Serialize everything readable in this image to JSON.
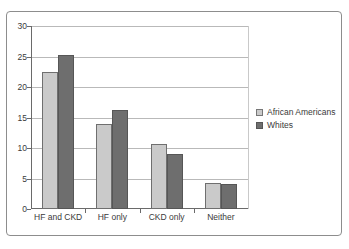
{
  "chart_data": {
    "type": "bar",
    "title": "",
    "subtitle": "",
    "xlabel": "",
    "ylabel": "",
    "categories": [
      "HF and CKD",
      "HF only",
      "CKD only",
      "Neither"
    ],
    "series": [
      {
        "name": "African Americans",
        "color": "#cacaca",
        "values": [
          22.5,
          13.9,
          10.6,
          4.3
        ]
      },
      {
        "name": "Whites",
        "color": "#6e6e6e",
        "values": [
          25.2,
          16.2,
          9.0,
          4.1
        ]
      }
    ],
    "ylim": [
      0,
      30
    ],
    "yticks": [
      "0",
      "5",
      "10",
      "15",
      "20",
      "25",
      "30"
    ],
    "ytick_values": [
      0,
      5,
      10,
      15,
      20,
      25,
      30
    ],
    "grid": "horizontal",
    "legend_position": "right",
    "annotations": []
  },
  "legend": {
    "entries": [
      {
        "label": "African Americans"
      },
      {
        "label": "Whites"
      }
    ]
  },
  "colors": {
    "series_african_americans": "#cacaca",
    "series_whites": "#6e6e6e",
    "gridline": "#b9b9b9",
    "axis": "#6a6a6a",
    "frame": "#8d8d8d",
    "text": "#3a3a3a",
    "background": "#ffffff"
  }
}
